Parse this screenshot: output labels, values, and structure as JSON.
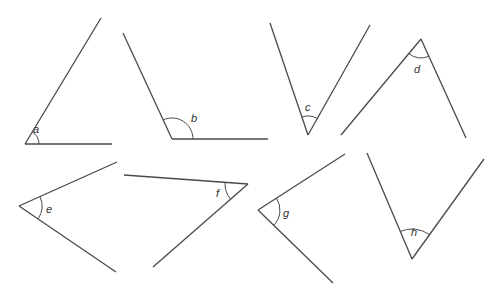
{
  "diagram": {
    "type": "angle-estimation-worksheet",
    "stroke_color": "#4a4a4a",
    "angles": [
      {
        "label": "a",
        "vertex": [
          25,
          144
        ],
        "p1": [
          101,
          18
        ],
        "p2": [
          112,
          144
        ],
        "arc_r": 14,
        "label_pos": [
          33,
          133
        ]
      },
      {
        "label": "b",
        "vertex": [
          172,
          139
        ],
        "p1": [
          123,
          33
        ],
        "p2": [
          268,
          139
        ],
        "arc_r": 21,
        "label_pos": [
          191,
          122
        ]
      },
      {
        "label": "c",
        "vertex": [
          308,
          135
        ],
        "p1": [
          270,
          23
        ],
        "p2": [
          370,
          25
        ],
        "arc_r": 19,
        "label_pos": [
          305,
          111
        ]
      },
      {
        "label": "d",
        "vertex": [
          421,
          39
        ],
        "p1": [
          341,
          135
        ],
        "p2": [
          466,
          138
        ],
        "arc_r": 19,
        "label_pos": [
          414,
          73
        ]
      },
      {
        "label": "e",
        "vertex": [
          19,
          206
        ],
        "p1": [
          117,
          162
        ],
        "p2": [
          116,
          272
        ],
        "arc_r": 23,
        "label_pos": [
          46,
          213
        ]
      },
      {
        "label": "f",
        "vertex": [
          248,
          184
        ],
        "p1": [
          124,
          175
        ],
        "p2": [
          153,
          267
        ],
        "arc_r": 23,
        "label_pos": [
          216,
          197
        ]
      },
      {
        "label": "g",
        "vertex": [
          258,
          210
        ],
        "p1": [
          345,
          154
        ],
        "p2": [
          333,
          283
        ],
        "arc_r": 22,
        "label_pos": [
          283,
          217
        ]
      },
      {
        "label": "h",
        "vertex": [
          412,
          259
        ],
        "p1": [
          367,
          153
        ],
        "p2": [
          484,
          159
        ],
        "arc_r": 30,
        "label_pos": [
          411,
          236
        ]
      }
    ]
  }
}
